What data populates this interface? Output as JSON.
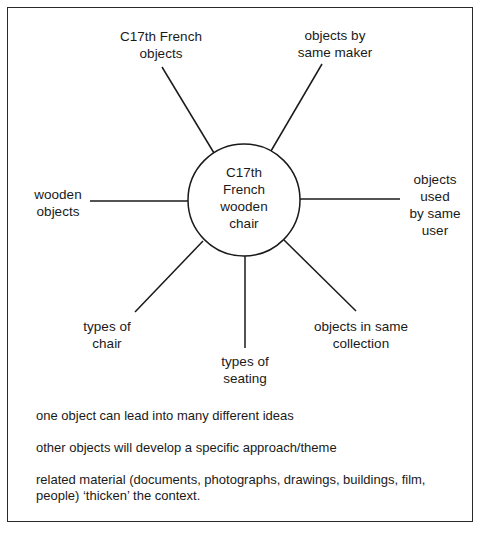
{
  "diagram": {
    "type": "mind-map",
    "center": {
      "lines": [
        "C17th",
        "French",
        "wooden",
        "chair"
      ]
    },
    "nodes": [
      {
        "id": "c17th-french-objects",
        "lines": [
          "C17th French",
          "objects"
        ]
      },
      {
        "id": "objects-by-same-maker",
        "lines": [
          "objects by",
          "same maker"
        ]
      },
      {
        "id": "wooden-objects",
        "lines": [
          "wooden",
          "objects"
        ]
      },
      {
        "id": "objects-used-by-same-user",
        "lines": [
          "objects",
          "used",
          "by same",
          "user"
        ]
      },
      {
        "id": "types-of-chair",
        "lines": [
          "types of",
          "chair"
        ]
      },
      {
        "id": "types-of-seating",
        "lines": [
          "types of",
          "seating"
        ]
      },
      {
        "id": "objects-in-same-collection",
        "lines": [
          "objects in same",
          "collection"
        ]
      }
    ],
    "edges": [
      {
        "from": "center",
        "to": "c17th-french-objects"
      },
      {
        "from": "center",
        "to": "objects-by-same-maker"
      },
      {
        "from": "center",
        "to": "wooden-objects"
      },
      {
        "from": "center",
        "to": "objects-used-by-same-user"
      },
      {
        "from": "center",
        "to": "types-of-chair"
      },
      {
        "from": "center",
        "to": "types-of-seating"
      },
      {
        "from": "center",
        "to": "objects-in-same-collection"
      }
    ]
  },
  "notes": [
    "one object can lead into many different ideas",
    "other objects will develop a specific approach/theme",
    "related material (documents, photographs, drawings, buildings, film, people) ‘thicken’ the context."
  ],
  "colors": {
    "line": "#1a1a1a",
    "background": "#ffffff",
    "text": "#1a1a1a"
  }
}
